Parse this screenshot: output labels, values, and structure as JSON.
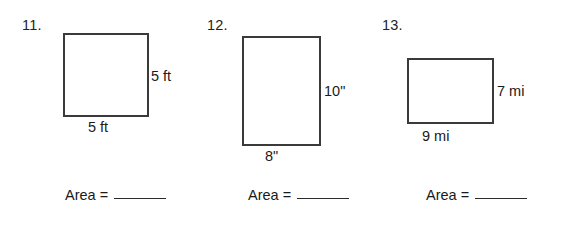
{
  "page": {
    "background_color": "#ffffff",
    "figure_stroke_color": "#3a3a3a",
    "text_color": "#1a1a1a"
  },
  "problems": [
    {
      "number": "11.",
      "shape": "square",
      "height_label": "5 ft",
      "width_label": "5 ft",
      "area_label": "Area =",
      "area_value": ""
    },
    {
      "number": "12.",
      "shape": "rectangle",
      "height_label": "10\"",
      "width_label": "8\"",
      "area_label": "Area =",
      "area_value": ""
    },
    {
      "number": "13.",
      "shape": "rectangle",
      "height_label": "7 mi",
      "width_label": "9 mi",
      "area_label": "Area =",
      "area_value": ""
    }
  ]
}
